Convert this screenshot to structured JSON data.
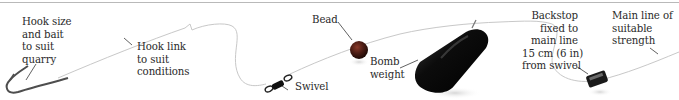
{
  "diagram": {
    "colors": {
      "background": "#ffffff",
      "line": "#c8c8c8",
      "leader": "#3a3a3a",
      "text": "#2a2a2a",
      "bead": "#4a1c14",
      "weight": "#111111",
      "hook": "#555555"
    },
    "components": [
      {
        "id": "hook",
        "name": "Hook"
      },
      {
        "id": "hook-link",
        "name": "Hook link"
      },
      {
        "id": "swivel",
        "name": "Swivel"
      },
      {
        "id": "bead",
        "name": "Bead"
      },
      {
        "id": "bomb-weight",
        "name": "Bomb weight"
      },
      {
        "id": "backstop",
        "name": "Backstop"
      },
      {
        "id": "main-line",
        "name": "Main line"
      }
    ],
    "labels": {
      "hook": "Hook size\nand bait\nto suit\nquarry",
      "hook_link": "Hook link\nto suit\nconditions",
      "swivel": "Swivel",
      "bead": "Bead",
      "bomb_weight": "Bomb\nweight",
      "backstop": "Backstop\nfixed to\nmain line\n15 cm (6 in)\nfrom swivel",
      "main_line": "Main line of\nsuitable\nstrength"
    }
  }
}
